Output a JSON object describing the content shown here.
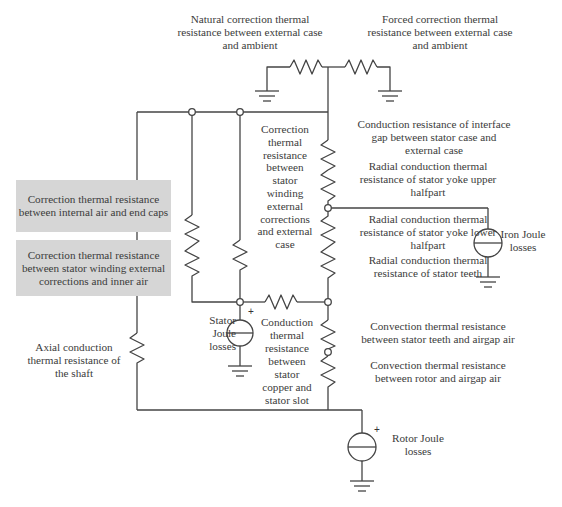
{
  "diagram": {
    "type": "thermal equivalent circuit",
    "colors": {
      "wire": "#444444",
      "box_fill": "#d6d6d6",
      "text": "#3b3b3b"
    }
  },
  "labels": {
    "natural_correction": "Natural correction thermal\nresistance between external case\nand ambient",
    "forced_correction": "Forced correction thermal\nresistance between external case\nand ambient",
    "interface_gap": "Conduction resistance of interface\ngap between stator case and\nexternal case",
    "yoke_upper": "Radial conduction thermal\nresistance of stator yoke upper\nhalfpart",
    "yoke_lower": "Radial conduction thermal\nresistance of stator yoke lower\nhalfpart",
    "stator_teeth": "Radial conduction thermal\nresistance of stator teeth",
    "winding_external_case": "Correction\nthermal\nresistance\nbetween\nstator\nwinding\nexternal\ncorrections\nand external\ncase",
    "iron_joule": "Iron Joule\nlosses",
    "stator_joule": "Stator\nJoule\nlosses",
    "copper_slot": "Conduction\nthermal\nresistance\nbetween\nstator\ncopper and\nstator slot",
    "teeth_airgap": "Convection thermal resistance\nbetween stator teeth and airgap air",
    "rotor_airgap": "Convection thermal resistance\nbetween rotor and airgap air",
    "shaft": "Axial conduction\nthermal resistance of\nthe shaft",
    "rotor_joule": "Rotor Joule\nlosses"
  },
  "boxes": {
    "end_caps": "Correction thermal resistance\nbetween internal air and end caps",
    "inner_air": "Correction thermal resistance\nbetween stator winding external\ncorrections and inner air"
  },
  "symbols": {
    "plus": "+"
  }
}
